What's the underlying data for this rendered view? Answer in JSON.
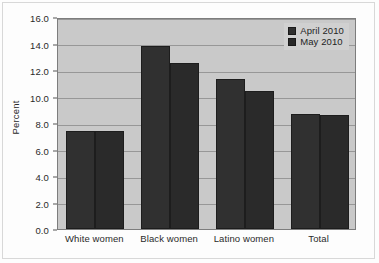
{
  "chart_data": {
    "type": "bar",
    "title": "",
    "subtitle": "",
    "xlabel": "",
    "ylabel": "Percent",
    "categories": [
      "White women",
      "Black women",
      "Latino women",
      "Total"
    ],
    "series": [
      {
        "name": "April 2010",
        "values": [
          7.4,
          13.8,
          11.3,
          8.7
        ],
        "color": "#303030"
      },
      {
        "name": "May 2010",
        "values": [
          7.4,
          12.5,
          10.4,
          8.6
        ],
        "color": "#2a2a2a"
      }
    ],
    "ylim": [
      0.0,
      16.0
    ],
    "ytick_values": [
      0.0,
      2.0,
      4.0,
      6.0,
      8.0,
      10.0,
      12.0,
      14.0,
      16.0
    ],
    "ytick_labels": [
      "0.0",
      "2.0",
      "4.0",
      "6.0",
      "8.0",
      "10.0",
      "12.0",
      "14.0",
      "16.0"
    ],
    "grid": true,
    "grid_axis": "y",
    "legend_position": "top-right",
    "legend_inside_axes": true,
    "plot_background": "#c9c9c9",
    "figure_background": "#fdfdfd",
    "gridline_color": "#8e8e8e",
    "axis_border_color": "#7d7d7d",
    "bar_group_gap_fraction": 0.35
  },
  "axes": {
    "ylabel": "Percent"
  },
  "legend": {
    "items": [
      {
        "label": "April 2010"
      },
      {
        "label": "May 2010"
      }
    ]
  }
}
